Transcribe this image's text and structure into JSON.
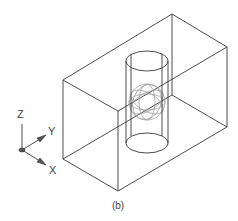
{
  "figure": {
    "caption": "(b)"
  },
  "ucs_icon": {
    "axes": [
      {
        "name": "Z",
        "label": "Z"
      },
      {
        "name": "Y",
        "label": "Y"
      },
      {
        "name": "X",
        "label": "X"
      }
    ]
  },
  "colors": {
    "edges": "#3a3a3a",
    "sphere_wire": "#9a9a9a",
    "background": "#ffffff"
  }
}
